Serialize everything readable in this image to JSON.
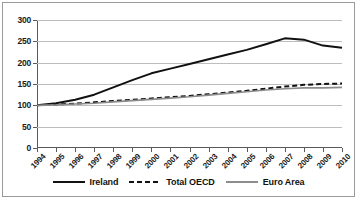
{
  "chart_data": {
    "type": "line",
    "title": "",
    "subtitle": "",
    "xlabel": "",
    "ylabel": "",
    "x": [
      1994,
      1995,
      1996,
      1997,
      1998,
      1999,
      2000,
      2001,
      2002,
      2003,
      2004,
      2005,
      2006,
      2007,
      2008,
      2009,
      2010
    ],
    "categories": [
      "1994",
      "1995",
      "1996",
      "1997",
      "1998",
      "1999",
      "2000",
      "2001",
      "2002",
      "2003",
      "2004",
      "2005",
      "2006",
      "2007",
      "2008",
      "2009",
      "2010"
    ],
    "xlim": [
      1994,
      2010
    ],
    "ylim": [
      0,
      300
    ],
    "yticks": [
      0,
      50,
      100,
      150,
      200,
      250,
      300
    ],
    "ytick_labels": [
      "0",
      "50",
      "100",
      "150",
      "200",
      "250",
      "300"
    ],
    "grid": "horizontal",
    "legend_position": "bottom",
    "series": [
      {
        "name": "Ireland",
        "color": "#111111",
        "style": "solid",
        "values": [
          100,
          105,
          113,
          125,
          142,
          159,
          175,
          186,
          197,
          208,
          219,
          230,
          243,
          257,
          254,
          240,
          235
        ]
      },
      {
        "name": "Total OECD",
        "color": "#111111",
        "style": "dashed",
        "values": [
          100,
          102,
          104,
          107,
          110,
          113,
          116,
          119,
          122,
          126,
          130,
          134,
          139,
          144,
          148,
          150,
          151
        ]
      },
      {
        "name": "Euro Area",
        "color": "#8c8c8c",
        "style": "solid",
        "values": [
          100,
          101,
          103,
          105,
          108,
          111,
          114,
          117,
          120,
          124,
          128,
          132,
          136,
          139,
          141,
          141,
          142
        ]
      }
    ]
  },
  "legend": {
    "items": [
      {
        "label": "Ireland",
        "style": "solid",
        "color": "#111111"
      },
      {
        "label": "Total OECD",
        "style": "dashed",
        "color": "#111111"
      },
      {
        "label": "Euro Area",
        "style": "solid",
        "color": "#8c8c8c"
      }
    ]
  },
  "colors": {
    "ireland": "#111111",
    "total_oecd": "#111111",
    "euro_area": "#8c8c8c",
    "gridline": "#bdbdbd",
    "axis": "#5a5a5a",
    "border": "#9a9a9a",
    "background": "#ffffff"
  }
}
